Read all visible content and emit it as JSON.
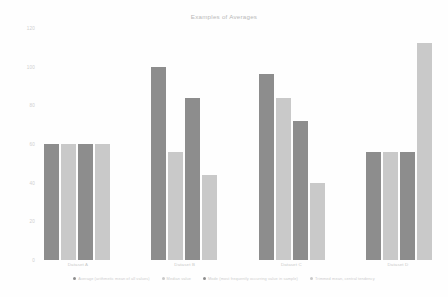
{
  "chart_data": {
    "type": "bar",
    "title": "Examples of Averages",
    "xlabel": "",
    "ylabel": "",
    "ylim": [
      0,
      120
    ],
    "grid": false,
    "legend_position": "bottom",
    "categories": [
      "Dataset A",
      "Dataset B",
      "Dataset C",
      "Dataset D"
    ],
    "yticks": [
      "120",
      "100",
      "80",
      "60",
      "40",
      "20",
      "0"
    ],
    "series": [
      {
        "name": "Average (arithmetic mean of all values)",
        "color": "#8d8d8d",
        "values": [
          60,
          100,
          96,
          56
        ]
      },
      {
        "name": "Median value",
        "color": "#c9c9c9",
        "values": [
          60,
          56,
          84,
          56
        ]
      },
      {
        "name": "Mode (most frequently occurring value in sample)",
        "color": "#8d8d8d",
        "values": [
          60,
          84,
          72,
          56
        ]
      },
      {
        "name": "Trimmed mean, central tendency",
        "color": "#c9c9c9",
        "values": [
          60,
          44,
          40,
          112
        ]
      }
    ]
  },
  "legend": {
    "items": [
      {
        "label": "Average (arithmetic mean of all values)",
        "color": "#8d8d8d"
      },
      {
        "label": "Median value",
        "color": "#c9c9c9"
      },
      {
        "label": "Mode (most frequently occurring value in sample)",
        "color": "#8d8d8d"
      },
      {
        "label": "Trimmed mean, central tendency",
        "color": "#c9c9c9"
      }
    ]
  }
}
